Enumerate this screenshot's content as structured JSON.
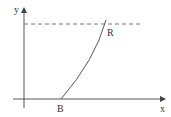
{
  "diagram": {
    "axes": {
      "x_label": "x",
      "y_label": "y"
    },
    "points": {
      "start_label": "B",
      "end_label": "R"
    },
    "curve": {
      "from": "B",
      "to": "R",
      "description": "curve rising from B on x-axis to R on dashed horizontal line"
    },
    "dashed_line": {
      "description": "horizontal dashed line at top level"
    },
    "colors": {
      "stroke": "#444444",
      "text": "#333333"
    }
  }
}
